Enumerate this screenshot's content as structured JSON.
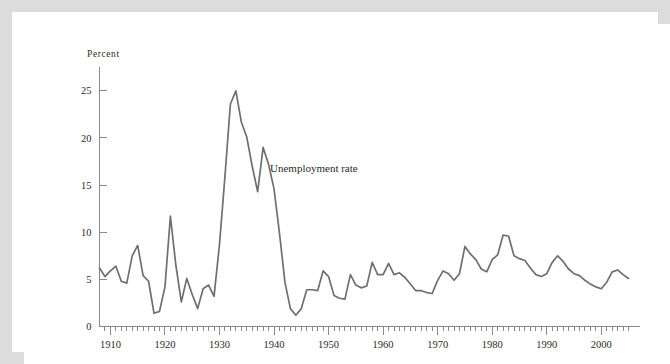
{
  "figure": {
    "background_color": "#ffffff",
    "border_color": "#dcdcdc",
    "line_color": "#6f6f6f",
    "axis_color": "#8a8a8a",
    "text_color": "#2b2b2b"
  },
  "axes": {
    "y_axis_title": "Percent",
    "y_tick_labels": [
      "0",
      "5",
      "10",
      "15",
      "20",
      "25"
    ],
    "x_tick_labels": [
      "1910",
      "1920",
      "1930",
      "1940",
      "1950",
      "1960",
      "1970",
      "1980",
      "1990",
      "2000"
    ]
  },
  "annotations": {
    "series_label": "Unemployment rate"
  },
  "chart_data": {
    "type": "line",
    "title": "",
    "xlabel": "",
    "ylabel": "Percent",
    "xlim": [
      1908,
      2006
    ],
    "ylim": [
      0,
      27
    ],
    "yticks": [
      0,
      5,
      10,
      15,
      20,
      25
    ],
    "xticks": [
      1910,
      1920,
      1930,
      1940,
      1950,
      1960,
      1970,
      1980,
      1990,
      2000
    ],
    "x_minor_tick_interval": 1,
    "grid": false,
    "legend": "none",
    "annotations": [
      {
        "text": "Unemployment rate",
        "x": 1941,
        "y": 19.2
      }
    ],
    "series": [
      {
        "name": "Unemployment rate",
        "color": "#6f6f6f",
        "x": [
          1908,
          1909,
          1910,
          1911,
          1912,
          1913,
          1914,
          1915,
          1916,
          1917,
          1918,
          1919,
          1920,
          1921,
          1922,
          1923,
          1924,
          1925,
          1926,
          1927,
          1928,
          1929,
          1930,
          1931,
          1932,
          1933,
          1934,
          1935,
          1936,
          1937,
          1938,
          1939,
          1940,
          1941,
          1942,
          1943,
          1944,
          1945,
          1946,
          1947,
          1948,
          1949,
          1950,
          1951,
          1952,
          1953,
          1954,
          1955,
          1956,
          1957,
          1958,
          1959,
          1960,
          1961,
          1962,
          1963,
          1964,
          1965,
          1966,
          1967,
          1968,
          1969,
          1970,
          1971,
          1972,
          1973,
          1974,
          1975,
          1976,
          1977,
          1978,
          1979,
          1980,
          1981,
          1982,
          1983,
          1984,
          1985,
          1986,
          1987,
          1988,
          1989,
          1990,
          1991,
          1992,
          1993,
          1994,
          1995,
          1996,
          1997,
          1998,
          1999,
          2000,
          2001,
          2002,
          2003,
          2004,
          2005
        ],
        "values": [
          6.2,
          5.3,
          5.9,
          6.4,
          4.8,
          4.6,
          7.5,
          8.6,
          5.4,
          4.8,
          1.4,
          1.6,
          4.2,
          11.7,
          6.5,
          2.6,
          5.1,
          3.4,
          1.9,
          4.0,
          4.4,
          3.2,
          8.7,
          15.9,
          23.6,
          25.0,
          21.7,
          20.1,
          17.0,
          14.3,
          19.0,
          17.2,
          14.6,
          9.9,
          4.7,
          1.9,
          1.2,
          1.9,
          3.9,
          3.9,
          3.8,
          5.9,
          5.3,
          3.3,
          3.0,
          2.9,
          5.5,
          4.4,
          4.1,
          4.3,
          6.8,
          5.5,
          5.5,
          6.7,
          5.5,
          5.7,
          5.2,
          4.5,
          3.8,
          3.8,
          3.6,
          3.5,
          4.9,
          5.9,
          5.6,
          4.9,
          5.6,
          8.5,
          7.7,
          7.1,
          6.1,
          5.8,
          7.1,
          7.6,
          9.7,
          9.6,
          7.5,
          7.2,
          7.0,
          6.2,
          5.5,
          5.3,
          5.6,
          6.8,
          7.5,
          6.9,
          6.1,
          5.6,
          5.4,
          4.9,
          4.5,
          4.2,
          4.0,
          4.7,
          5.8,
          6.0,
          5.5,
          5.1
        ]
      }
    ]
  }
}
